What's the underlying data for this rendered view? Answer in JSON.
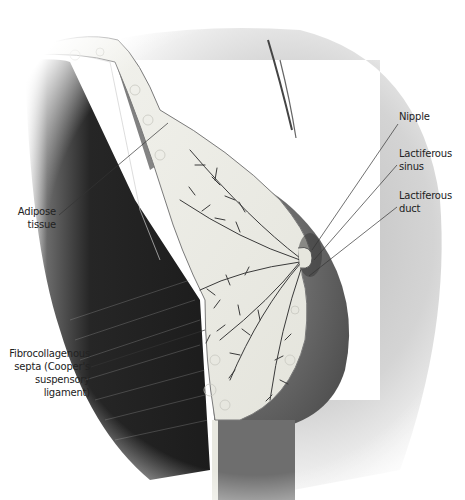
{
  "figure": {
    "colors": {
      "background": "#ffffff",
      "skin": "#d8d8d8",
      "muscle": "#2a2a2a",
      "glandular": "#efefe8",
      "duct": "#3a3a3a",
      "label_text": "#222222",
      "leader_line": "#333333"
    }
  },
  "labels": {
    "nipple": {
      "lines": [
        "Nipple"
      ]
    },
    "lactiferous_sinus": {
      "lines": [
        "Lactiferous",
        "sinus"
      ]
    },
    "lactiferous_duct": {
      "lines": [
        "Lactiferous",
        "duct"
      ]
    },
    "adipose_tissue": {
      "lines": [
        "Adipose",
        "tissue"
      ]
    },
    "fibrocollagenous_septa": {
      "lines": [
        "Fibrocollagenous",
        "septa (Cooper's",
        "suspensory ligament)"
      ]
    }
  }
}
